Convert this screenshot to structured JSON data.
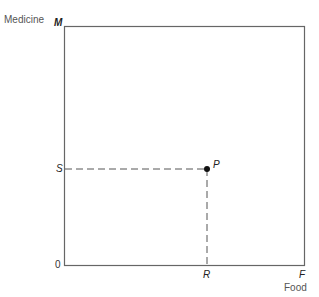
{
  "diagram": {
    "y_axis_label": "Medicine",
    "x_axis_label": "Food",
    "origin_label": "0",
    "y_max_label": "M",
    "x_max_label": "F",
    "point_label": "P",
    "point_x_label": "R",
    "point_y_label": "S",
    "colors": {
      "axis": "#555555",
      "dashed": "#555555",
      "point": "#111111"
    }
  }
}
